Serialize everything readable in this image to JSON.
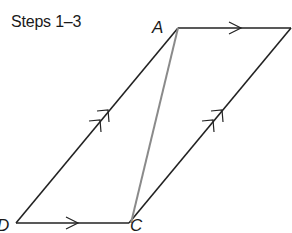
{
  "title": "Steps 1–3",
  "vertices": {
    "A": {
      "label": "A",
      "x": 178,
      "y": 28
    },
    "B": {
      "label": "",
      "x": 291,
      "y": 28
    },
    "C": {
      "label": "C",
      "x": 129,
      "y": 223
    },
    "D": {
      "label": "D",
      "x": 16,
      "y": 223
    }
  },
  "segments": [
    {
      "from": "A",
      "to": "B",
      "marker": "single-arrow",
      "color": "#222222"
    },
    {
      "from": "D",
      "to": "C",
      "marker": "single-arrow",
      "color": "#222222"
    },
    {
      "from": "D",
      "to": "A",
      "marker": "double-arrow",
      "color": "#222222"
    },
    {
      "from": "C",
      "to": "B",
      "marker": "double-arrow",
      "color": "#222222"
    },
    {
      "from": "A",
      "to": "C",
      "marker": "none",
      "color": "#8a8a8a"
    }
  ],
  "colors": {
    "line": "#222222",
    "diagonal": "#8a8a8a",
    "background": "#ffffff"
  }
}
